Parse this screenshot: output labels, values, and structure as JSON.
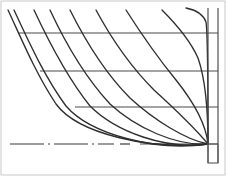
{
  "drawing": {
    "title": "Hull Lines Plan",
    "subtitle": "Body plan half-breadth station curves",
    "width": 226,
    "height": 176,
    "background_color": "#ffffff",
    "curve_color": "#2e2e2e",
    "waterline_color": "#4a4a4a",
    "baseline_color": "#3a3a3a",
    "border_color": "#c9c9c9"
  },
  "chart_data": {
    "type": "line",
    "xlabel": "",
    "ylabel": "",
    "xlim": [
      0,
      226
    ],
    "ylim": [
      176,
      0
    ],
    "grid": false,
    "legend_position": "none",
    "convergence_point": {
      "x": 208,
      "y": 144
    },
    "series": [
      {
        "name": "station-1",
        "path": "M 8,10 C 22,40 36,74 56,104 C 78,134 150,150 208,144"
      },
      {
        "name": "station-2",
        "path": "M 14,10 C 28,40 44,76 66,106 C 90,134 156,152 208,144"
      },
      {
        "name": "station-3",
        "path": "M 34,10 C 48,40 66,76 90,106 C 116,132 166,150 208,144"
      },
      {
        "name": "station-4",
        "path": "M 50,10 C 64,40 84,76 110,104 C 136,128 176,146 208,144"
      },
      {
        "name": "station-5",
        "path": "M 70,10 C 84,38 104,72 130,98 C 154,120 186,140 208,144"
      },
      {
        "name": "station-6",
        "path": "M 96,10 C 110,36 130,66 154,90 C 176,110 198,132 208,144"
      },
      {
        "name": "station-7",
        "path": "M 126,10 C 140,32 158,58 176,80 C 192,100 206,124 208,144"
      },
      {
        "name": "station-8",
        "path": "M 162,10 C 176,24 190,40 198,58 C 205,78 208,110 208,144"
      },
      {
        "name": "station-9",
        "path": "M 186,8 C 196,10 203,14 206,22 C 208,34 208,90 208,144"
      }
    ],
    "waterlines": [
      {
        "name": "waterline-1",
        "y": 33,
        "x_start": 18,
        "x_end": 218
      },
      {
        "name": "waterline-2",
        "y": 71,
        "x_start": 40,
        "x_end": 218
      },
      {
        "name": "waterline-3",
        "y": 107,
        "x_start": 75,
        "x_end": 218
      },
      {
        "name": "waterline-4",
        "y": 144,
        "x_start": 140,
        "x_end": 218
      }
    ],
    "vertical_references": [
      {
        "name": "centerline",
        "x": 208,
        "y_start": 8,
        "y_end": 163
      },
      {
        "name": "outer-perpendicular",
        "x": 218,
        "y_start": 8,
        "y_end": 163
      }
    ],
    "stem_box": {
      "x": 208,
      "y": 144,
      "width": 10,
      "height": 19
    },
    "baseline": {
      "name": "baseline-centerline",
      "y": 144,
      "x_start": 10,
      "x_end": 114,
      "style": "dash-dot",
      "stub_x_start": 120,
      "stub_x_end": 130
    },
    "border": {
      "x": 1,
      "y": 1,
      "width": 224,
      "height": 174
    }
  }
}
